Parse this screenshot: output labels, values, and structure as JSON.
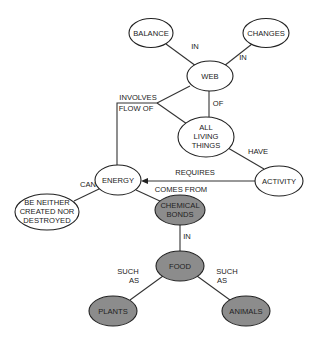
{
  "diagram": {
    "type": "concept-map",
    "colors": {
      "background": "#ffffff",
      "stroke": "#222222",
      "plain_fill": "#ffffff",
      "shaded_fill": "#8c8c8c",
      "text": "#222222"
    },
    "nodes": {
      "balance": {
        "lines": [
          "BALANCE"
        ],
        "shaded": false
      },
      "changes": {
        "lines": [
          "CHANGES"
        ],
        "shaded": false
      },
      "web": {
        "lines": [
          "WEB"
        ],
        "shaded": false
      },
      "all_living_things": {
        "lines": [
          "ALL",
          "LIVING",
          "THINGS"
        ],
        "shaded": false
      },
      "activity": {
        "lines": [
          "ACTIVITY"
        ],
        "shaded": false
      },
      "energy": {
        "lines": [
          "ENERGY"
        ],
        "shaded": false
      },
      "be_neither": {
        "lines": [
          "BE NEITHER",
          "CREATED NOR",
          "DESTROYED"
        ],
        "shaded": false
      },
      "chemical_bonds": {
        "lines": [
          "CHEMICAL",
          "BONDS"
        ],
        "shaded": true
      },
      "food": {
        "lines": [
          "FOOD"
        ],
        "shaded": true
      },
      "plants": {
        "lines": [
          "PLANTS"
        ],
        "shaded": true
      },
      "animals": {
        "lines": [
          "ANIMALS"
        ],
        "shaded": true
      }
    },
    "edges": {
      "balance_web": {
        "from": "BALANCE",
        "to": "WEB",
        "label": [
          "IN"
        ]
      },
      "changes_web": {
        "from": "CHANGES",
        "to": "WEB",
        "label": [
          "IN"
        ]
      },
      "web_living": {
        "from": "WEB",
        "to": "ALL LIVING THINGS",
        "label": [
          "OF"
        ]
      },
      "energy_flow": {
        "from": "ENERGY",
        "to": [
          "WEB",
          "ALL LIVING THINGS"
        ],
        "label": [
          "INVOLVES",
          "FLOW OF"
        ]
      },
      "living_activity": {
        "from": "ALL LIVING THINGS",
        "to": "ACTIVITY",
        "label": [
          "HAVE"
        ]
      },
      "activity_energy": {
        "from": "ACTIVITY",
        "to": "ENERGY",
        "label": [
          "REQUIRES"
        ],
        "arrow": true
      },
      "energy_neither": {
        "from": "ENERGY",
        "to": "BE NEITHER CREATED NOR DESTROYED",
        "label": [
          "CAN"
        ]
      },
      "energy_bonds": {
        "from": "ENERGY",
        "to": "CHEMICAL BONDS",
        "label": [
          "COMES FROM"
        ]
      },
      "bonds_food": {
        "from": "CHEMICAL BONDS",
        "to": "FOOD",
        "label": [
          "IN"
        ]
      },
      "food_plants": {
        "from": "FOOD",
        "to": "PLANTS",
        "label": [
          "SUCH",
          "AS"
        ]
      },
      "food_animals": {
        "from": "FOOD",
        "to": "ANIMALS",
        "label": [
          "SUCH",
          "AS"
        ]
      }
    }
  }
}
